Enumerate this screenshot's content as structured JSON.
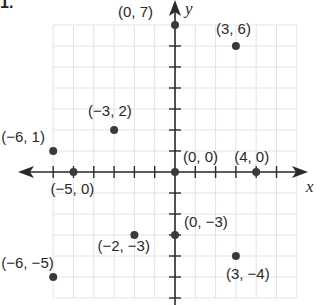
{
  "problem": {
    "number": "1."
  },
  "chart_data": {
    "type": "scatter",
    "title": "",
    "xlabel": "x",
    "ylabel": "y",
    "xlim": [
      -6,
      6
    ],
    "ylim": [
      -6,
      7
    ],
    "grid": true,
    "legend": null,
    "points": [
      {
        "x": 0,
        "y": 7,
        "label": "(0, 7)"
      },
      {
        "x": 3,
        "y": 6,
        "label": "(3, 6)"
      },
      {
        "x": -3,
        "y": 2,
        "label": "(−3, 2)"
      },
      {
        "x": -6,
        "y": 1,
        "label": "(−6, 1)"
      },
      {
        "x": 0,
        "y": 0,
        "label": "(0, 0)"
      },
      {
        "x": 4,
        "y": 0,
        "label": "(4, 0)"
      },
      {
        "x": -5,
        "y": 0,
        "label": "(−5, 0)"
      },
      {
        "x": 0,
        "y": -3,
        "label": "(0, −3)"
      },
      {
        "x": -2,
        "y": -3,
        "label": "(−2, −3)"
      },
      {
        "x": -6,
        "y": -5,
        "label": "(−6, −5)"
      },
      {
        "x": 3,
        "y": -4,
        "label": "(3, −4)"
      }
    ]
  },
  "colors": {
    "grid": "#e3e3e3",
    "axis": "#2a2a2a",
    "point": "#3a3a3a",
    "text": "#2a2a2a"
  }
}
